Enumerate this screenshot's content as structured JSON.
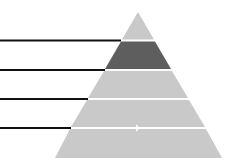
{
  "diagram": {
    "type": "pyramid",
    "levels": 5,
    "colors": {
      "light": "#c9c9c9",
      "highlight": "#5e5e5e",
      "separator": "#ffffff",
      "leader_line": "#111111"
    },
    "highlighted_level": 2,
    "leader_lines": 4
  }
}
